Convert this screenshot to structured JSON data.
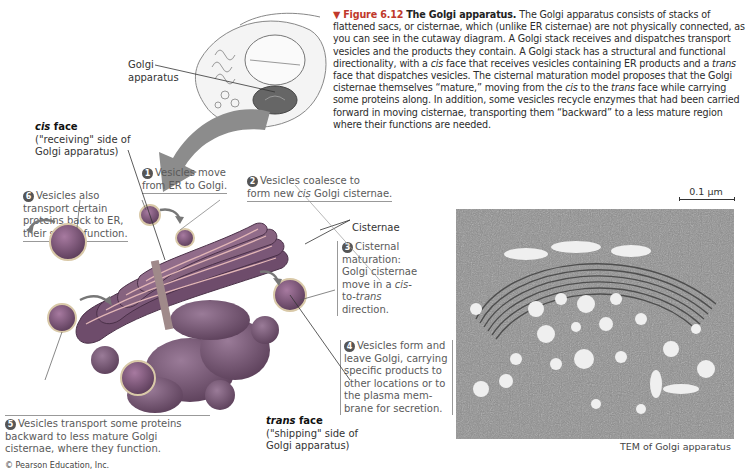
{
  "caption": {
    "marker": "▼",
    "figure_number": "Figure 6.12",
    "title": "The Golgi apparatus.",
    "body": [
      "The Golgi apparatus consists of stacks of flattened sacs, or cisternae, which (unlike ER cisternae) are not physically connected, as you can see in the cutaway diagram. A Golgi stack receives and dispatches transport vesicles and the products they contain. A Golgi stack has a structural and functional directionality, with a ",
      "cis",
      " face that receives vesicles containing ER products and a ",
      "trans",
      " face that dispatches vesicles. The cisternal maturation model proposes that the Golgi cisternae themselves “mature,” moving from the ",
      "cis",
      " to the ",
      "trans",
      " face while carrying some proteins along. In addition, some vesicles recycle enzymes that had been carried forward in moving cisternae, transporting them “backward” to a less mature region where their functions are needed."
    ]
  },
  "cell_inset": {
    "label_line1": "Golgi",
    "label_line2": "apparatus"
  },
  "cis_face": {
    "title_italic": "cis",
    "title_rest": " face",
    "line1": "(\"receiving\" side of",
    "line2": "Golgi apparatus)"
  },
  "trans_face": {
    "title_italic": "trans",
    "title_rest": " face",
    "line1": "(\"shipping\" side of",
    "line2": "Golgi apparatus)"
  },
  "cisternae_label": "Cisternae",
  "steps": [
    {
      "num": "1",
      "lines": [
        "Vesicles move",
        "from ER to Golgi."
      ]
    },
    {
      "num": "2",
      "line1": "Vesicles coalesce to",
      "line2_pre": "form new ",
      "line2_em": "cis",
      "line2_post": " Golgi cisternae."
    },
    {
      "num": "3",
      "line1": "Cisternal",
      "line2": "maturation:",
      "line3": "Golgi cisternae",
      "line4_pre": "move in a ",
      "line4_em": "cis-",
      "line5_pre": "to-",
      "line5_em": "trans",
      "line6": "direction."
    },
    {
      "num": "4",
      "lines": [
        "Vesicles form and",
        "leave Golgi, carrying",
        "specific products to",
        "other locations or to",
        "the plasma mem-",
        "brane for secretion."
      ]
    },
    {
      "num": "5",
      "lines": [
        "Vesicles transport some proteins",
        "backward to less mature Golgi",
        "cisternae, where they function."
      ]
    },
    {
      "num": "6",
      "lines": [
        "Vesicles also",
        "transport certain",
        "proteins back to ER,",
        "their site of function."
      ]
    }
  ],
  "micrograph": {
    "scale_bar": "0.1 µm",
    "label": "TEM of Golgi apparatus"
  },
  "credit": "© Pearson Education, Inc.",
  "colors": {
    "figure_red": "#c0392b",
    "golgi_purple": "#7d5a7a",
    "golgi_lumen": "#c98a8a",
    "arrow_gray": "#8c8c8c"
  }
}
